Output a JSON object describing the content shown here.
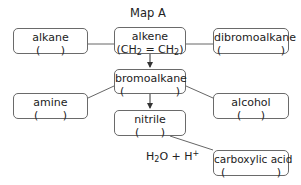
{
  "title": "Map A",
  "nodes": {
    "alkane": {
      "name": "alkane",
      "open": "(",
      "close": ")"
    },
    "alkene": {
      "name": "alkene",
      "formula_open": "(CH",
      "sub1": "2",
      "eq": " = CH",
      "sub2": "2",
      "formula_close": ")"
    },
    "dibromoalkane": {
      "name": "dibromoalkane",
      "open": "(",
      "close": ")"
    },
    "bromoalkane": {
      "name": "bromoalkane",
      "open": "(",
      "close": ")"
    },
    "amine": {
      "name": "amine",
      "open": "(",
      "close": ")"
    },
    "alcohol": {
      "name": "alcohol",
      "open": "(",
      "close": ")"
    },
    "nitrile": {
      "name": "nitrile",
      "open": "(",
      "close": ")"
    },
    "carboxylic_acid": {
      "name": "carboxylic acid",
      "open": "(",
      "close": ")"
    }
  },
  "reagent_label": {
    "h": "H",
    "sub": "2",
    "rest": "O + H",
    "sup": "+"
  }
}
